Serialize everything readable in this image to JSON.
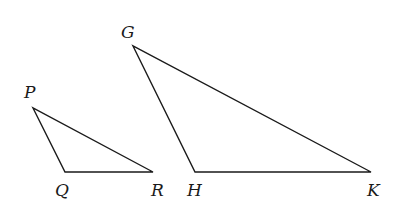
{
  "figure": {
    "stroke_color": "#1a1a1a",
    "background_color": "#ffffff",
    "triangles": [
      {
        "name": "PQR",
        "vertices": {
          "P": {
            "x": 33,
            "y": 108
          },
          "Q": {
            "x": 65,
            "y": 172
          },
          "R": {
            "x": 153,
            "y": 172
          }
        }
      },
      {
        "name": "GHK",
        "vertices": {
          "G": {
            "x": 133,
            "y": 46
          },
          "H": {
            "x": 195,
            "y": 172
          },
          "K": {
            "x": 371,
            "y": 172
          }
        }
      }
    ],
    "labels": {
      "P": "P",
      "Q": "Q",
      "R": "R",
      "G": "G",
      "H": "H",
      "K": "K"
    }
  }
}
